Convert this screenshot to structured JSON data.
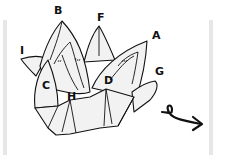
{
  "diagram": {
    "labels": [
      {
        "id": "A",
        "text": "A",
        "x": 152,
        "y": 30
      },
      {
        "id": "B",
        "text": "B",
        "x": 54,
        "y": 5
      },
      {
        "id": "C",
        "text": "C",
        "x": 42,
        "y": 80
      },
      {
        "id": "D",
        "text": "D",
        "x": 104,
        "y": 75
      },
      {
        "id": "F",
        "text": "F",
        "x": 97,
        "y": 12
      },
      {
        "id": "G",
        "text": "G",
        "x": 155,
        "y": 66
      },
      {
        "id": "H",
        "text": "H",
        "x": 67,
        "y": 91
      },
      {
        "id": "I",
        "text": "I",
        "x": 20,
        "y": 45
      }
    ],
    "symbols": [
      {
        "name": "turn-over-arrow",
        "meaning": "turn the model over"
      }
    ],
    "colors": {
      "line": "#111111",
      "fill": "#f2f2f2",
      "edge_bar": "#e6e6e6"
    }
  }
}
